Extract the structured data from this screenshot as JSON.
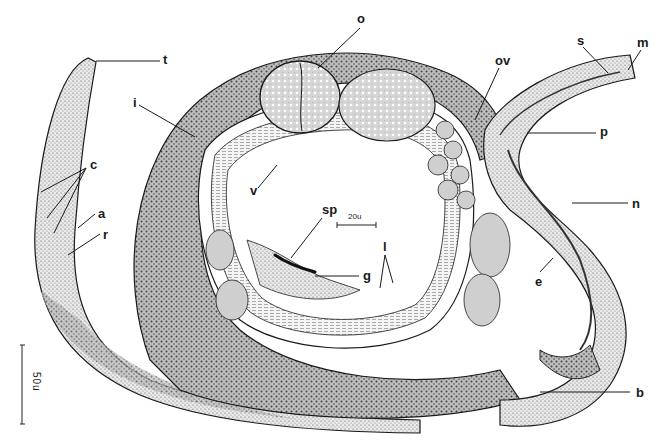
{
  "figure": {
    "labels": [
      {
        "id": "t",
        "text": "t",
        "x": 163,
        "y": 53,
        "line": [
          [
            96,
            61
          ],
          [
            160,
            61
          ]
        ]
      },
      {
        "id": "o",
        "text": "o",
        "x": 357,
        "y": 12,
        "line": [
          [
            360,
            28
          ],
          [
            318,
            68
          ]
        ]
      },
      {
        "id": "ov",
        "text": "ov",
        "x": 495,
        "y": 54,
        "line": [
          [
            499,
            68
          ],
          [
            475,
            120
          ]
        ]
      },
      {
        "id": "s",
        "text": "s",
        "x": 577,
        "y": 34,
        "line": [
          [
            583,
            47
          ],
          [
            608,
            73
          ]
        ]
      },
      {
        "id": "m",
        "text": "m",
        "x": 637,
        "y": 36,
        "line": [
          [
            641,
            50
          ],
          [
            628,
            70
          ]
        ]
      },
      {
        "id": "p",
        "text": "p",
        "x": 600,
        "y": 125,
        "line": [
          [
            527,
            133
          ],
          [
            596,
            133
          ]
        ]
      },
      {
        "id": "n",
        "text": "n",
        "x": 632,
        "y": 197,
        "line": [
          [
            572,
            203
          ],
          [
            628,
            203
          ]
        ]
      },
      {
        "id": "i",
        "text": "i",
        "x": 133,
        "y": 96,
        "line": [
          [
            139,
            105
          ],
          [
            195,
            137
          ]
        ]
      },
      {
        "id": "v",
        "text": "v",
        "x": 250,
        "y": 184,
        "line": [
          [
            258,
            188
          ],
          [
            277,
            165
          ]
        ]
      },
      {
        "id": "c",
        "text": "c",
        "x": 90,
        "y": 158,
        "line_multi": [
          [
            [
              86,
              168
            ],
            [
              41,
              192
            ]
          ],
          [
            [
              86,
              168
            ],
            [
              47,
              218
            ]
          ],
          [
            [
              86,
              168
            ],
            [
              54,
              233
            ]
          ]
        ]
      },
      {
        "id": "a",
        "text": "a",
        "x": 98,
        "y": 207,
        "line": [
          [
            95,
            214
          ],
          [
            78,
            228
          ]
        ]
      },
      {
        "id": "r",
        "text": "r",
        "x": 103,
        "y": 228,
        "line": [
          [
            100,
            234
          ],
          [
            68,
            255
          ]
        ]
      },
      {
        "id": "sp",
        "text": "sp",
        "x": 322,
        "y": 203,
        "line": [
          [
            322,
            218
          ],
          [
            291,
            258
          ]
        ]
      },
      {
        "id": "g",
        "text": "g",
        "x": 363,
        "y": 269,
        "line": [
          [
            315,
            276
          ],
          [
            359,
            276
          ]
        ]
      },
      {
        "id": "l",
        "text": "l",
        "x": 383,
        "y": 240,
        "line_multi": [
          [
            [
              385,
              255
            ],
            [
              380,
              288
            ]
          ],
          [
            [
              385,
              255
            ],
            [
              393,
              283
            ]
          ]
        ]
      },
      {
        "id": "e",
        "text": "e",
        "x": 535,
        "y": 275,
        "line": [
          [
            540,
            272
          ],
          [
            553,
            258
          ]
        ]
      },
      {
        "id": "b",
        "text": "b",
        "x": 636,
        "y": 386,
        "line": [
          [
            540,
            392
          ],
          [
            630,
            392
          ]
        ]
      }
    ],
    "inset_scale": {
      "text": "20u",
      "x1": 337,
      "x2": 376,
      "y": 225
    },
    "main_scale": {
      "text": "50u",
      "x": 22,
      "y1": 345,
      "y2": 424
    },
    "colors": {
      "ink": "#1a1a1a",
      "paper": "#ffffff",
      "stipple": "#9a9a9a"
    }
  }
}
